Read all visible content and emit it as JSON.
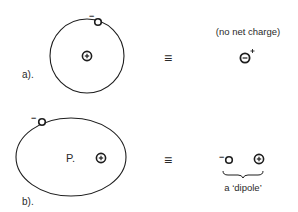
{
  "diagram": {
    "part_a": {
      "label": "a).",
      "electron_charge": "−",
      "nucleus_charge": "+",
      "equiv_symbol": "≡",
      "annotation": "(no net charge)",
      "neutral_symbol_inner": "−",
      "neutral_symbol_sup": "+"
    },
    "part_b": {
      "label": "b).",
      "electron_charge": "−",
      "nucleus_charge": "+",
      "point_label": "P.",
      "equiv_symbol": "≡",
      "dipole_minus": "−",
      "dipole_plus": "+",
      "dipole_label": "a ‘dipole’"
    },
    "colors": {
      "stroke": "#1e1e1e",
      "text": "#2a2a2a",
      "background": "#ffffff"
    }
  }
}
